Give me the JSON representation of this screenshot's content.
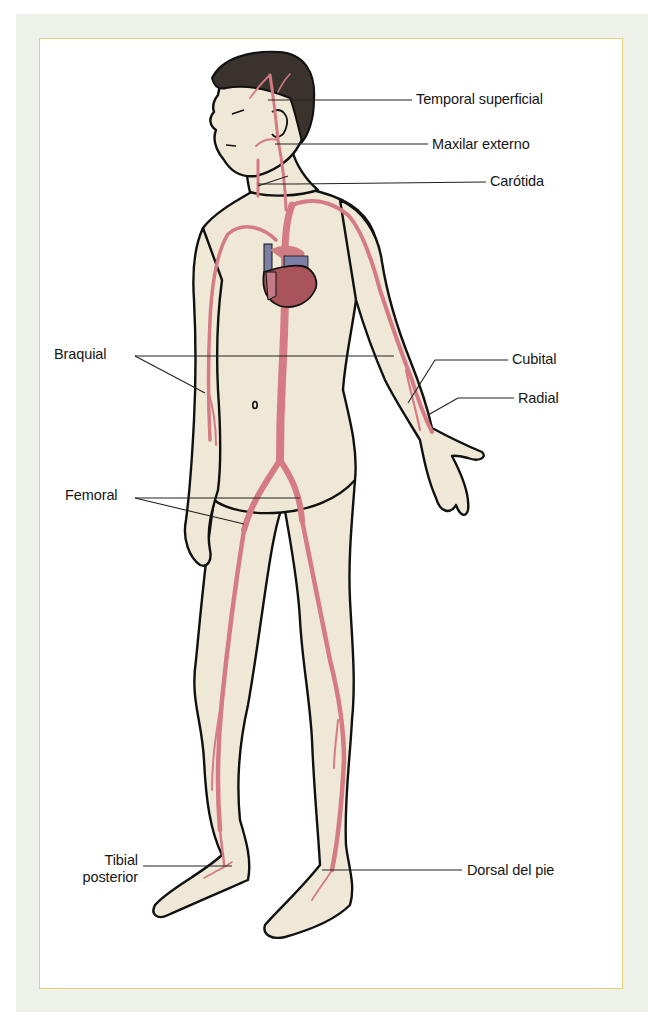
{
  "figure": {
    "colors": {
      "skin": "#efe8d6",
      "outline": "#111111",
      "artery": "#d57b83",
      "heart": "#a8545a",
      "vein_blue": "#7c7fa6",
      "hair": "#3a322c",
      "panel_border": "#e6cf7a",
      "outer_bg": "#eef0ea"
    }
  },
  "labels": {
    "temporal_superficial": "Temporal superficial",
    "maxilar_externo": "Maxilar externo",
    "carotida": "Carótida",
    "braquial": "Braquial",
    "cubital": "Cubital",
    "radial": "Radial",
    "femoral": "Femoral",
    "tibial_posterior_line1": "Tibial",
    "tibial_posterior_line2": "posterior",
    "dorsal_del_pie": "Dorsal del pie"
  }
}
